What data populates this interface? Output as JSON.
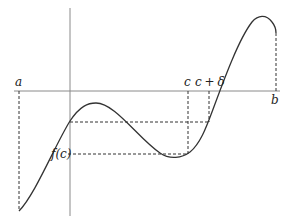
{
  "figure": {
    "labels": {
      "a": "a",
      "b": "b",
      "c": "c",
      "c_plus_delta": "c + δ",
      "f_of_c": "f(c)"
    },
    "colors": {
      "curve": "#333333",
      "axes": "#888888",
      "dashed": "#333333",
      "background": "#ffffff"
    }
  }
}
